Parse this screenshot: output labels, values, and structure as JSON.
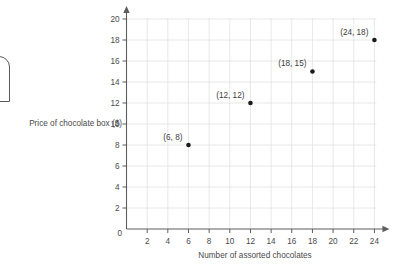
{
  "chart_data": {
    "type": "scatter",
    "title": "",
    "xlabel": "Number of assorted chocolates",
    "ylabel": "Price of chocolate box ($)",
    "xlim": [
      0,
      25
    ],
    "ylim": [
      0,
      21
    ],
    "xticks": [
      0,
      2,
      4,
      6,
      8,
      10,
      12,
      14,
      16,
      18,
      20,
      22,
      24
    ],
    "yticks": [
      0,
      2,
      4,
      6,
      8,
      10,
      12,
      14,
      16,
      18,
      20
    ],
    "xtick_labels": [
      "0",
      "2",
      "4",
      "6",
      "8",
      "10",
      "12",
      "14",
      "16",
      "18",
      "20",
      "22",
      "24"
    ],
    "ytick_labels": [
      "0",
      "2",
      "4",
      "6",
      "8",
      "10",
      "12",
      "14",
      "16",
      "18",
      "20"
    ],
    "grid": true,
    "legend": "none",
    "x": [
      6,
      12,
      18,
      24
    ],
    "y": [
      8,
      12,
      15,
      18
    ],
    "points": [
      {
        "x": 6,
        "y": 8,
        "label": "(6, 8)"
      },
      {
        "x": 12,
        "y": 12,
        "label": "(12, 12)"
      },
      {
        "x": 18,
        "y": 15,
        "label": "(18, 15)"
      },
      {
        "x": 24,
        "y": 18,
        "label": "(24, 18)"
      }
    ],
    "point_color": "#1b1b1b",
    "grid_color": "#e2e2e2",
    "axis_color": "#5d5d5d",
    "text_color": "#4a4a4a"
  },
  "axes": {
    "x_title": "Number of assorted chocolates",
    "y_title": "Price of chocolate box ($)",
    "origin_label": "0"
  },
  "decoration": {
    "edge_shape_name": "clipped-rounded-shape"
  }
}
